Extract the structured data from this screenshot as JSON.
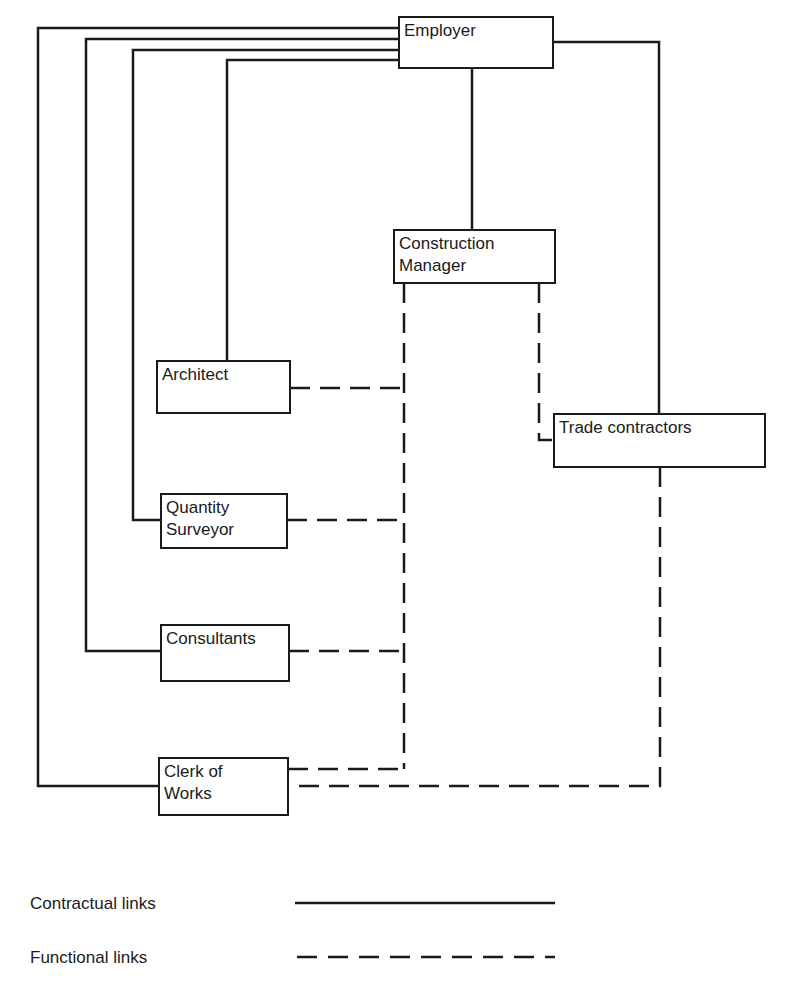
{
  "diagram": {
    "type": "organisation-structure",
    "nodes": [
      {
        "id": "employer",
        "label": "Employer"
      },
      {
        "id": "construction_manager",
        "label": "Construction\nManager"
      },
      {
        "id": "architect",
        "label": "Architect"
      },
      {
        "id": "quantity_surveyor",
        "label": "Quantity\nSurveyor"
      },
      {
        "id": "consultants",
        "label": "Consultants"
      },
      {
        "id": "clerk_of_works",
        "label": "Clerk of\nWorks"
      },
      {
        "id": "trade_contractors",
        "label": "Trade contractors"
      }
    ],
    "edges": [
      {
        "from": "employer",
        "to": "construction_manager",
        "type": "contractual"
      },
      {
        "from": "employer",
        "to": "architect",
        "type": "contractual"
      },
      {
        "from": "employer",
        "to": "quantity_surveyor",
        "type": "contractual"
      },
      {
        "from": "employer",
        "to": "consultants",
        "type": "contractual"
      },
      {
        "from": "employer",
        "to": "clerk_of_works",
        "type": "contractual"
      },
      {
        "from": "employer",
        "to": "trade_contractors",
        "type": "contractual"
      },
      {
        "from": "construction_manager",
        "to": "architect",
        "type": "functional"
      },
      {
        "from": "construction_manager",
        "to": "quantity_surveyor",
        "type": "functional"
      },
      {
        "from": "construction_manager",
        "to": "consultants",
        "type": "functional"
      },
      {
        "from": "construction_manager",
        "to": "clerk_of_works",
        "type": "functional"
      },
      {
        "from": "construction_manager",
        "to": "trade_contractors",
        "type": "functional"
      },
      {
        "from": "trade_contractors",
        "to": "clerk_of_works",
        "type": "functional"
      }
    ]
  },
  "legend": {
    "contractual": {
      "label": "Contractual links",
      "style": "solid"
    },
    "functional": {
      "label": "Functional links",
      "style": "dashed"
    }
  },
  "colors": {
    "line": "#1a1a1a",
    "background": "#ffffff"
  }
}
